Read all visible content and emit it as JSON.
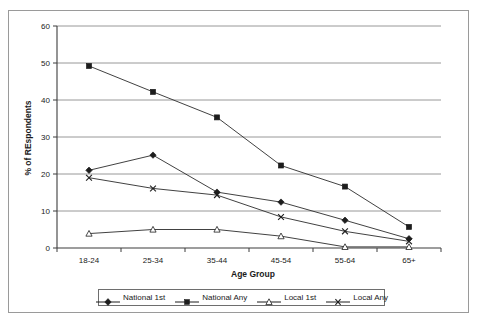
{
  "chart_data": {
    "type": "line",
    "title": "",
    "xlabel": "Age Group",
    "ylabel": "% of REspondents",
    "categories": [
      "18-24",
      "25-34",
      "35-44",
      "45-54",
      "55-64",
      "65+"
    ],
    "ylim": [
      0,
      60
    ],
    "yticks": [
      0,
      10,
      20,
      30,
      40,
      50,
      60
    ],
    "ytick_labels": [
      "0",
      "10",
      "20",
      "30",
      "40",
      "50",
      "60"
    ],
    "grid": "horizontal",
    "legend_position": "bottom",
    "series": [
      {
        "name": "National 1st",
        "marker": "filled-diamond",
        "values": [
          21.0,
          25.1,
          15.1,
          12.4,
          7.5,
          2.5
        ]
      },
      {
        "name": "National Any",
        "marker": "filled-square",
        "values": [
          49.2,
          42.2,
          35.3,
          22.3,
          16.6,
          5.7
        ]
      },
      {
        "name": "Local 1st",
        "marker": "open-triangle",
        "values": [
          3.9,
          5.0,
          5.0,
          3.2,
          0.3,
          0.3
        ]
      },
      {
        "name": "Local Any",
        "marker": "x-star",
        "values": [
          19.0,
          16.1,
          14.3,
          8.4,
          4.5,
          1.8
        ]
      }
    ]
  },
  "axes": {
    "y_title": "% of REspondents",
    "x_title": "Age Group"
  },
  "legend": {
    "items": [
      {
        "label": "National 1st",
        "marker": "filled-diamond"
      },
      {
        "label": "National Any",
        "marker": "filled-square"
      },
      {
        "label": "Local 1st",
        "marker": "open-triangle"
      },
      {
        "label": "Local Any",
        "marker": "x-star"
      }
    ]
  },
  "colors": {
    "line": "#2b2b2b",
    "grid": "#8d8d8d",
    "axis": "#3d3d3d",
    "frame": "#9a9a9a",
    "background": "#ffffff"
  }
}
